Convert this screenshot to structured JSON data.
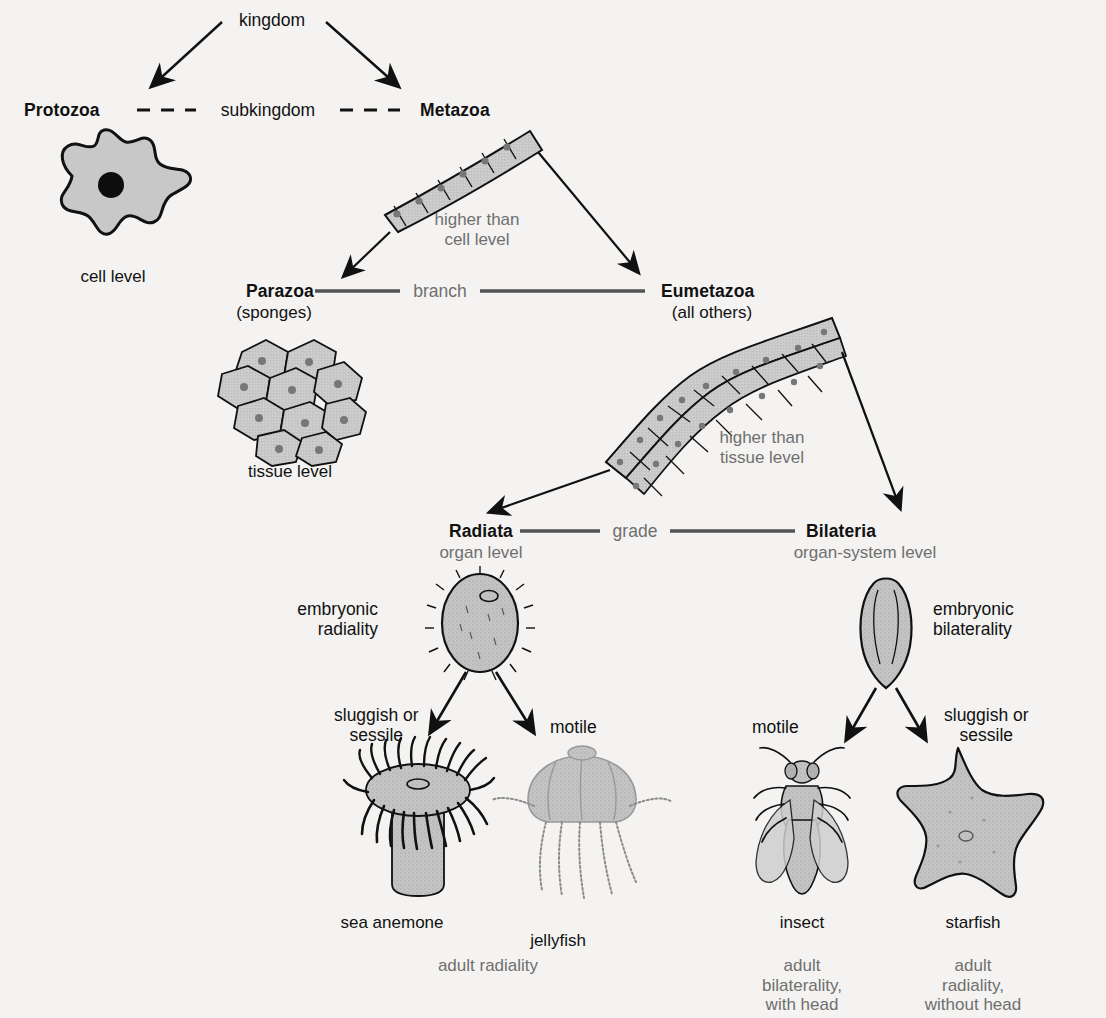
{
  "diagram": {
    "background_color": "#f4f3f1",
    "fill_gray": "#c8c8c8",
    "outline_color": "#111111",
    "gray_text_color": "#6f6f6f"
  },
  "levels": {
    "kingdom": "kingdom",
    "subkingdom": "subkingdom",
    "branch": "branch",
    "grade": "grade"
  },
  "taxa": {
    "protozoa": {
      "name": "Protozoa",
      "level_caption": "cell level"
    },
    "metazoa": {
      "name": "Metazoa"
    },
    "parazoa": {
      "name": "Parazoa",
      "qualifier": "(sponges)",
      "level_caption": "tissue level"
    },
    "eumetazoa": {
      "name": "Eumetazoa",
      "qualifier": "(all others)"
    },
    "radiata": {
      "name": "Radiata",
      "level_caption": "organ level"
    },
    "bilateria": {
      "name": "Bilateria",
      "level_caption": "organ-system level"
    }
  },
  "organization_notes": {
    "higher_than_cell": "higher than\ncell level",
    "higher_than_tissue": "higher than\ntissue level"
  },
  "symmetry": {
    "radial_embryo": "embryonic\nradiality",
    "bilateral_embryo": "embryonic\nbilaterality"
  },
  "lifestyles": {
    "radiata_left": "sluggish or\nsessile",
    "radiata_right": "motile",
    "bilateria_left": "motile",
    "bilateria_right": "sluggish or\nsessile"
  },
  "organisms": {
    "sea_anemone": "sea anemone",
    "jellyfish": "jellyfish",
    "insect": "insect",
    "starfish": "starfish"
  },
  "adult_outcomes": {
    "radiata": "adult radiality",
    "insect": "adult\nbilaterality,\nwith head",
    "starfish": "adult\nradiality,\nwithout head"
  }
}
